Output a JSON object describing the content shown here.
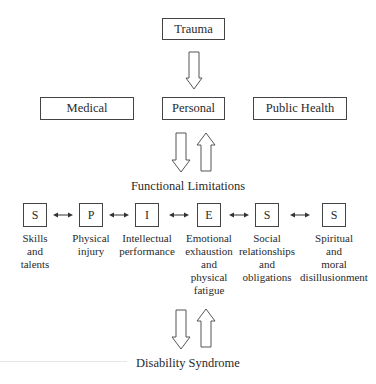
{
  "diagram": {
    "top": {
      "label": "Trauma"
    },
    "domains": [
      {
        "label": "Medical"
      },
      {
        "label": "Personal"
      },
      {
        "label": "Public Health"
      }
    ],
    "middle_title": "Functional Limitations",
    "limitations": [
      {
        "letter": "S",
        "description": "Skills\nand\ntalents"
      },
      {
        "letter": "P",
        "description": "Physical\ninjury"
      },
      {
        "letter": "I",
        "description": "Intellectual\nperformance"
      },
      {
        "letter": "E",
        "description": "Emotional\nexhaustion\nand\nphysical\nfatigue"
      },
      {
        "letter": "S",
        "description": "Social\nrelationships\nand\nobligations"
      },
      {
        "letter": "S",
        "description": "Spiritual\nand\nmoral\ndisillusionment"
      }
    ],
    "bottom_title": "Disability Syndrome"
  }
}
